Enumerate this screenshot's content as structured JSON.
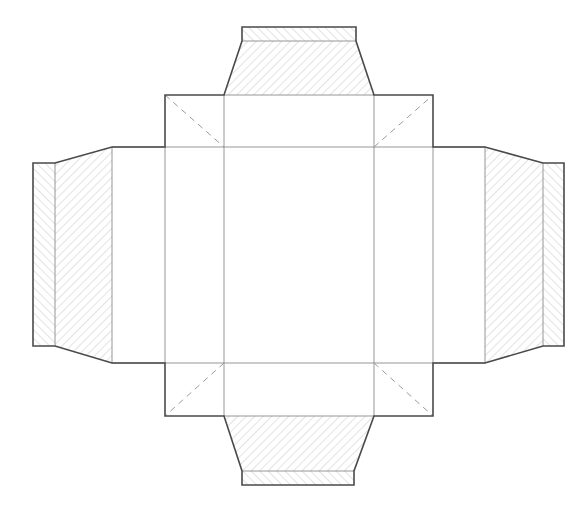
{
  "diagram": {
    "type": "box-net-dieline",
    "colors": {
      "background": "#ffffff",
      "outline": "#4a4a4a",
      "fold_line": "#8a8a8a",
      "dashed_fold": "#9a9a9a",
      "hatch": "#c8c8c8"
    },
    "panels": {
      "base": {
        "x": 224,
        "y": 147,
        "w": 150,
        "h": 216
      },
      "side_left": {
        "x": 112,
        "y": 147,
        "w": 53,
        "h": 216
      },
      "side_left_inner": {
        "x": 165,
        "y": 147,
        "w": 59,
        "h": 216
      },
      "side_right_inner": {
        "x": 374,
        "y": 147,
        "w": 59,
        "h": 216
      },
      "side_right": {
        "x": 433,
        "y": 147,
        "w": 52,
        "h": 216
      },
      "front_top": {
        "x": 224,
        "y": 95,
        "w": 150,
        "h": 52
      },
      "front_bottom": {
        "x": 224,
        "y": 363,
        "w": 150,
        "h": 53
      }
    },
    "corner_flaps": [
      {
        "name": "top-left",
        "x": 165,
        "y": 95,
        "w": 59,
        "h": 52,
        "diagonal": [
          [
            165,
            95
          ],
          [
            224,
            147
          ]
        ]
      },
      {
        "name": "top-right",
        "x": 374,
        "y": 95,
        "w": 59,
        "h": 52,
        "diagonal": [
          [
            374,
            147
          ],
          [
            433,
            95
          ]
        ]
      },
      {
        "name": "bottom-left",
        "x": 165,
        "y": 363,
        "w": 59,
        "h": 53,
        "diagonal": [
          [
            224,
            363
          ],
          [
            165,
            416
          ]
        ]
      },
      {
        "name": "bottom-right",
        "x": 374,
        "y": 363,
        "w": 59,
        "h": 53,
        "diagonal": [
          [
            374,
            363
          ],
          [
            433,
            416
          ]
        ]
      }
    ],
    "tuck_flaps": [
      {
        "name": "top",
        "trapezoid": [
          [
            224,
            95
          ],
          [
            374,
            95
          ],
          [
            356,
            41
          ],
          [
            242,
            41
          ]
        ],
        "strip": {
          "x": 242,
          "y": 27,
          "w": 114,
          "h": 14
        }
      },
      {
        "name": "bottom",
        "trapezoid": [
          [
            224,
            416
          ],
          [
            374,
            416
          ],
          [
            354,
            471
          ],
          [
            242,
            471
          ]
        ],
        "strip": {
          "x": 242,
          "y": 471,
          "w": 112,
          "h": 14
        }
      },
      {
        "name": "left",
        "trapezoid": [
          [
            112,
            147
          ],
          [
            112,
            363
          ],
          [
            55,
            346
          ],
          [
            55,
            163
          ]
        ],
        "strip": {
          "x": 33,
          "y": 163,
          "w": 22,
          "h": 183
        }
      },
      {
        "name": "right",
        "trapezoid": [
          [
            485,
            147
          ],
          [
            485,
            363
          ],
          [
            543,
            346
          ],
          [
            543,
            163
          ]
        ],
        "strip": {
          "x": 543,
          "y": 163,
          "w": 21,
          "h": 183
        }
      }
    ],
    "labels": []
  }
}
